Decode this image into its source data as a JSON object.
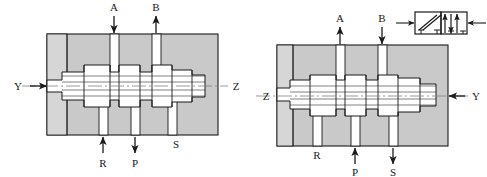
{
  "figure": {
    "kind": "hydraulic-spool-valve-cross-section",
    "colors": {
      "body_fill": "#c9c9c9",
      "body_fill_light": "#d6d6d6",
      "spool_fill": "#ffffff",
      "outline": "#1a1a1a",
      "arrow": "#1a1a1a",
      "centerline": "#808080",
      "symbol_line": "#1a1a1a"
    }
  },
  "views": [
    {
      "id": "left-view",
      "name": "position-a",
      "pilot_in": {
        "label": "Z",
        "side": "left",
        "arrow": "right",
        "has_arrow": true
      },
      "pilot_out": {
        "label": "Y",
        "side": "right",
        "arrow": "none",
        "has_arrow": false
      },
      "top_ports": [
        {
          "label": "A",
          "arrow": "down",
          "has_arrow": true
        },
        {
          "label": "B",
          "arrow": "up",
          "has_arrow": true
        }
      ],
      "bottom_ports": [
        {
          "label": "R",
          "arrow": "up",
          "has_arrow": true
        },
        {
          "label": "P",
          "arrow": "down",
          "has_arrow": true
        },
        {
          "label": "S",
          "arrow": "none",
          "has_arrow": false
        }
      ]
    },
    {
      "id": "right-view",
      "name": "position-b",
      "pilot_in": {
        "label": "Y",
        "side": "right",
        "arrow": "left",
        "has_arrow": true
      },
      "pilot_out": {
        "label": "Z",
        "side": "left",
        "arrow": "none",
        "has_arrow": false
      },
      "top_ports": [
        {
          "label": "A",
          "arrow": "up",
          "has_arrow": true
        },
        {
          "label": "B",
          "arrow": "down",
          "has_arrow": true
        }
      ],
      "bottom_ports": [
        {
          "label": "R",
          "arrow": "none",
          "has_arrow": false
        },
        {
          "label": "P",
          "arrow": "up",
          "has_arrow": true
        },
        {
          "label": "S",
          "arrow": "down",
          "has_arrow": true
        }
      ]
    }
  ],
  "symbol": {
    "id": "valve-schematic-symbol",
    "positions": 2,
    "left_cell": "crossed-flow-paths",
    "right_cell": "parallel-flow-arrows",
    "left_pilot_arrow": "right",
    "right_pilot_arrow": "left"
  }
}
